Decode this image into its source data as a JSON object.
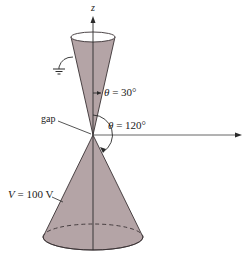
{
  "figure": {
    "axes": {
      "vertical_label": "z",
      "horizontal_label": ""
    },
    "upper_cone": {
      "half_angle_label_var": "θ",
      "half_angle_label_rest": " = 30°",
      "grounded": true
    },
    "lower_cone": {
      "angle_label_var": "θ",
      "angle_label_rest": " = 120°",
      "potential_label_var": "V",
      "potential_label_rest": " = 100 V"
    },
    "gap_label": "gap",
    "colors": {
      "cone_fill": "#b4a4a6",
      "cone_edge": "#3a3234",
      "line": "#2a2a2a",
      "background": "#ffffff"
    }
  }
}
